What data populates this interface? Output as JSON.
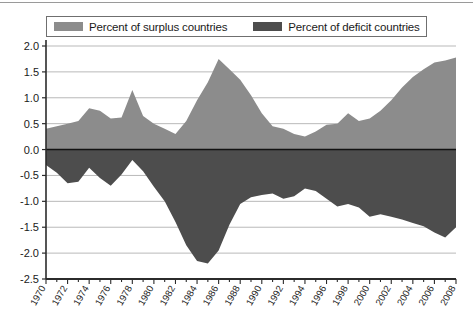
{
  "legend": {
    "surplus_label": "Percent of surplus countries",
    "deficit_label": "Percent of deficit countries",
    "surplus_color": "#8c8c8c",
    "deficit_color": "#4d4d4d"
  },
  "axis": {
    "y_ticks": [
      "2.0",
      "1.5",
      "1.0",
      "0.5",
      "0.0",
      "-0.5",
      "-1.0",
      "-1.5",
      "-2.0",
      "-2.5"
    ],
    "x_ticks": [
      "1970",
      "1972",
      "1974",
      "1976",
      "1978",
      "1980",
      "1982",
      "1984",
      "1986",
      "1988",
      "1990",
      "1992",
      "1994",
      "1996",
      "1998",
      "2000",
      "2002",
      "2004",
      "2006",
      "2008"
    ]
  },
  "chart_data": {
    "type": "area",
    "title": "",
    "subtitle": "",
    "xlabel": "",
    "ylabel": "",
    "xlim": [
      1970,
      2008
    ],
    "ylim": [
      -2.5,
      2.0
    ],
    "grid": true,
    "legend_position": "top",
    "x": [
      1970,
      1971,
      1972,
      1973,
      1974,
      1975,
      1976,
      1977,
      1978,
      1979,
      1980,
      1981,
      1982,
      1983,
      1984,
      1985,
      1986,
      1987,
      1988,
      1989,
      1990,
      1991,
      1992,
      1993,
      1994,
      1995,
      1996,
      1997,
      1998,
      1999,
      2000,
      2001,
      2002,
      2003,
      2004,
      2005,
      2006,
      2007,
      2008
    ],
    "series": [
      {
        "name": "Percent of surplus countries",
        "color": "#8c8c8c",
        "values": [
          0.4,
          0.45,
          0.5,
          0.55,
          0.8,
          0.75,
          0.6,
          0.62,
          1.15,
          0.65,
          0.5,
          0.4,
          0.3,
          0.55,
          0.95,
          1.3,
          1.75,
          1.55,
          1.35,
          1.05,
          0.7,
          0.45,
          0.4,
          0.3,
          0.25,
          0.35,
          0.48,
          0.5,
          0.7,
          0.55,
          0.6,
          0.75,
          0.95,
          1.2,
          1.4,
          1.55,
          1.68,
          1.72,
          1.78
        ]
      },
      {
        "name": "Percent of deficit countries",
        "color": "#4d4d4d",
        "values": [
          -0.3,
          -0.45,
          -0.65,
          -0.62,
          -0.35,
          -0.55,
          -0.7,
          -0.48,
          -0.2,
          -0.42,
          -0.72,
          -1.0,
          -1.4,
          -1.85,
          -2.15,
          -2.2,
          -1.95,
          -1.45,
          -1.05,
          -0.92,
          -0.88,
          -0.85,
          -0.95,
          -0.9,
          -0.75,
          -0.8,
          -0.95,
          -1.1,
          -1.05,
          -1.12,
          -1.3,
          -1.25,
          -1.3,
          -1.35,
          -1.42,
          -1.48,
          -1.6,
          -1.7,
          -1.5
        ]
      }
    ]
  }
}
